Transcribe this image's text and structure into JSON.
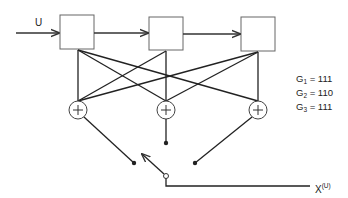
{
  "diagram": {
    "type": "convolutional-encoder",
    "input_label": "U",
    "output_label": "X",
    "output_superscript": "(U)",
    "shift_register_stages": 3,
    "adders": 3,
    "adder_symbol": "+",
    "generators": [
      {
        "name": "G",
        "index": "1",
        "value": "111"
      },
      {
        "name": "G",
        "index": "2",
        "value": "110"
      },
      {
        "name": "G",
        "index": "3",
        "value": "111"
      }
    ],
    "equals": "=",
    "colors": {
      "stroke": "#222222",
      "box": "#666666",
      "background": "#ffffff"
    }
  }
}
